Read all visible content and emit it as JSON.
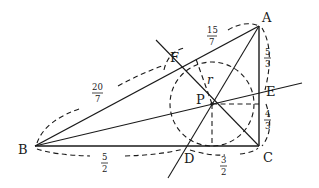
{
  "diagram": {
    "type": "triangle-incircle",
    "points": {
      "A": {
        "label": "A",
        "x": 259,
        "y": 26
      },
      "B": {
        "label": "B",
        "x": 35,
        "y": 146
      },
      "C": {
        "label": "C",
        "x": 259,
        "y": 146
      },
      "P": {
        "label": "P",
        "x": 212,
        "y": 104
      },
      "D": {
        "label": "D",
        "x": 186,
        "y": 146
      },
      "E": {
        "label": "E",
        "x": 259,
        "y": 98
      },
      "F": {
        "label": "F",
        "x": 180,
        "y": 65
      }
    },
    "incircle": {
      "center": "P",
      "radius": 42,
      "radius_label": "r"
    },
    "segment_labels": {
      "AF": {
        "num": "15",
        "den": "7"
      },
      "AE": {
        "num": "5",
        "den": "3"
      },
      "EC": {
        "num": "4",
        "den": "3"
      },
      "DC": {
        "num": "3",
        "den": "2"
      },
      "BD": {
        "num": "5",
        "den": "2"
      },
      "BF": {
        "num": "20",
        "den": "7"
      }
    }
  }
}
